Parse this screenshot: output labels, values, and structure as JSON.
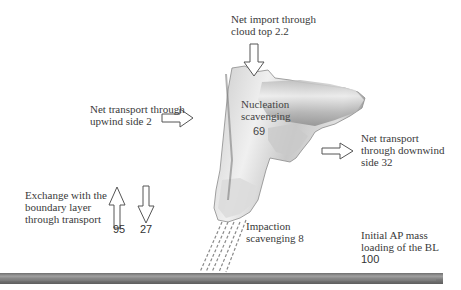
{
  "diagram": {
    "type": "cloud aerosol budget schematic",
    "colors": {
      "background": "#ffffff",
      "text": "#3a3a3a",
      "cloud_light": "#e8e8e8",
      "cloud_dark": "#8a8a8a",
      "ground": "#8c8c8c",
      "arrow_stroke": "#555555"
    },
    "labels": {
      "cloud_top": {
        "line1": "Net import through",
        "line2": "cloud top 2.2"
      },
      "upwind": {
        "line1": "Net transport through",
        "line2": "upwind side 2"
      },
      "nucleation": {
        "line1": "Nucleation",
        "line2": "scavenging",
        "value": "69"
      },
      "downwind": {
        "line1": "Net transport",
        "line2": "through downwind",
        "line3": "side 32"
      },
      "exchange": {
        "line1": "Exchange with the",
        "line2": "boundary layer",
        "line3": "through transport",
        "up_value": "95",
        "down_value": "27"
      },
      "impaction": {
        "line1": "Impaction",
        "line2": "scavenging 8"
      },
      "initial": {
        "line1": "Initial AP mass",
        "line2": "loading of the BL",
        "value": "100"
      }
    },
    "arrows": [
      {
        "name": "cloud-top-import",
        "direction": "down"
      },
      {
        "name": "upwind-transport",
        "direction": "right"
      },
      {
        "name": "downwind-transport",
        "direction": "right"
      },
      {
        "name": "bl-exchange-up",
        "direction": "up"
      },
      {
        "name": "bl-exchange-down",
        "direction": "down"
      }
    ]
  }
}
